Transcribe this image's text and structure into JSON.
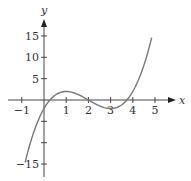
{
  "chart_data": {
    "type": "line",
    "title": "",
    "xlabel": "x",
    "ylabel": "y",
    "xlim": [
      -1.1,
      5.8
    ],
    "ylim": [
      -17.5,
      18.5
    ],
    "grid": false,
    "legend": null,
    "x_ticks": [
      -1,
      1,
      2,
      3,
      4,
      5
    ],
    "x_tick_labels": [
      "−1",
      "1",
      "2",
      "3",
      "4",
      "5"
    ],
    "y_ticks": [
      15,
      10,
      5,
      -5,
      -10,
      -15
    ],
    "y_tick_labels": [
      "15",
      "10",
      "5",
      "",
      "",
      "−15"
    ],
    "function": "y = x^3 - 6x^2 + 9x - 2",
    "series": [
      {
        "name": "f(x)",
        "color": "#777777",
        "x": [
          -0.85,
          -0.5,
          0,
          0.27,
          0.5,
          1,
          1.5,
          2,
          2.5,
          3,
          3.5,
          3.73,
          4,
          4.5,
          4.85
        ],
        "y": [
          -14.6,
          -8.1,
          -2,
          0,
          1.1,
          2,
          1.4,
          0,
          -1.4,
          -2,
          -1.1,
          0,
          2,
          8.1,
          14.6
        ]
      }
    ]
  },
  "axes": {
    "x_label": "x",
    "y_label": "y",
    "x_ticks": [
      {
        "value": -1,
        "label": "−1"
      },
      {
        "value": 1,
        "label": "1"
      },
      {
        "value": 2,
        "label": "2"
      },
      {
        "value": 3,
        "label": "3"
      },
      {
        "value": 4,
        "label": "4"
      },
      {
        "value": 5,
        "label": "5"
      }
    ],
    "y_ticks": [
      {
        "value": 15,
        "label": "15"
      },
      {
        "value": 10,
        "label": "10"
      },
      {
        "value": 5,
        "label": "5"
      },
      {
        "value": -5,
        "label": ""
      },
      {
        "value": -10,
        "label": ""
      },
      {
        "value": -15,
        "label": "−15"
      }
    ]
  },
  "colors": {
    "axis": "#444444",
    "curve": "#777777",
    "text": "#333333"
  }
}
